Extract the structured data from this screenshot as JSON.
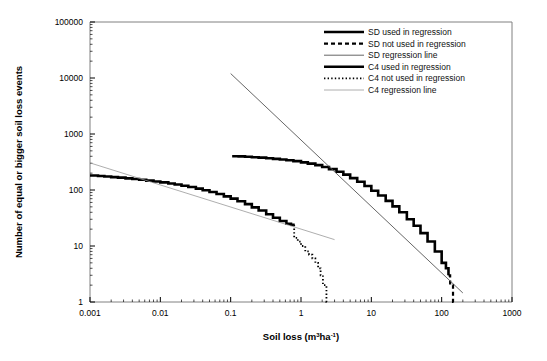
{
  "chart_data": {
    "type": "line",
    "title": "",
    "xlabel": "Soil loss (m3ha-1)",
    "xlabel_parts": {
      "base": "Soil loss (m",
      "sup1": "3",
      "mid": "ha",
      "sup2": "-1",
      "close": ")"
    },
    "ylabel": "Number of equal or bigger soil loss events",
    "xscale": "log",
    "yscale": "log",
    "xlim": [
      0.001,
      1000
    ],
    "ylim": [
      1,
      100000
    ],
    "grid": false,
    "legend_position": "top-right",
    "xticks": [
      "0.001",
      "0.01",
      "0.1",
      "1",
      "10",
      "100",
      "1000"
    ],
    "yticks": [
      "1",
      "10",
      "100",
      "1000",
      "10000",
      "100000"
    ],
    "colors": {
      "sd_used": "#000000",
      "sd_not_used": "#000000",
      "sd_regression": "#555555",
      "c4_used": "#000000",
      "c4_not_used": "#000000",
      "c4_regression": "#999999"
    },
    "series": [
      {
        "name": "SD used in regression",
        "style": "solid-thick",
        "color": "#000000",
        "points": [
          [
            0.105,
            400
          ],
          [
            0.13,
            398
          ],
          [
            0.16,
            392
          ],
          [
            0.2,
            385
          ],
          [
            0.25,
            378
          ],
          [
            0.32,
            370
          ],
          [
            0.4,
            360
          ],
          [
            0.5,
            350
          ],
          [
            0.62,
            340
          ],
          [
            0.78,
            328
          ],
          [
            1.0,
            312
          ],
          [
            1.25,
            296
          ],
          [
            1.6,
            278
          ],
          [
            2.0,
            258
          ],
          [
            2.5,
            236
          ],
          [
            3.2,
            212
          ],
          [
            4.0,
            188
          ],
          [
            5.0,
            163
          ],
          [
            6.3,
            140
          ],
          [
            8.0,
            118
          ],
          [
            10.0,
            97
          ],
          [
            12.5,
            80
          ],
          [
            16.0,
            64
          ],
          [
            20.0,
            51
          ],
          [
            25.0,
            40
          ],
          [
            32.0,
            30
          ],
          [
            40.0,
            23
          ],
          [
            50.0,
            17
          ],
          [
            63.0,
            12
          ],
          [
            80.0,
            8
          ],
          [
            100.0,
            5
          ],
          [
            115.0,
            4
          ],
          [
            125.0,
            3
          ]
        ]
      },
      {
        "name": "SD not used in regression",
        "style": "dashed",
        "color": "#000000",
        "points": [
          [
            125.0,
            3
          ],
          [
            130.0,
            3
          ],
          [
            132.0,
            2
          ],
          [
            140.0,
            2
          ],
          [
            145.0,
            1
          ],
          [
            148.0,
            1
          ]
        ]
      },
      {
        "name": "SD regression line",
        "style": "solid-thin",
        "color": "#555555",
        "points": [
          [
            0.1,
            12000
          ],
          [
            200.0,
            1.45
          ]
        ]
      },
      {
        "name": "C4 used in regression",
        "style": "solid-thick",
        "color": "#000000",
        "points": [
          [
            0.001,
            182
          ],
          [
            0.0013,
            178
          ],
          [
            0.0016,
            174
          ],
          [
            0.002,
            170
          ],
          [
            0.0025,
            166
          ],
          [
            0.0032,
            161
          ],
          [
            0.004,
            157
          ],
          [
            0.005,
            152
          ],
          [
            0.0063,
            147
          ],
          [
            0.008,
            142
          ],
          [
            0.01,
            137
          ],
          [
            0.013,
            131
          ],
          [
            0.016,
            125
          ],
          [
            0.02,
            119
          ],
          [
            0.025,
            113
          ],
          [
            0.032,
            106
          ],
          [
            0.04,
            99
          ],
          [
            0.05,
            92
          ],
          [
            0.063,
            85
          ],
          [
            0.08,
            77
          ],
          [
            0.1,
            70
          ],
          [
            0.125,
            63
          ],
          [
            0.16,
            56
          ],
          [
            0.2,
            49
          ],
          [
            0.25,
            43
          ],
          [
            0.32,
            37
          ],
          [
            0.4,
            32
          ],
          [
            0.5,
            28
          ],
          [
            0.62,
            25
          ],
          [
            0.72,
            24
          ],
          [
            0.78,
            23
          ]
        ]
      },
      {
        "name": "C4 not used in regression",
        "style": "dotted",
        "color": "#000000",
        "points": [
          [
            0.78,
            23
          ],
          [
            0.8,
            14
          ],
          [
            0.9,
            12
          ],
          [
            1.0,
            10
          ],
          [
            1.15,
            8
          ],
          [
            1.3,
            7
          ],
          [
            1.45,
            6
          ],
          [
            1.6,
            5
          ],
          [
            1.75,
            4
          ],
          [
            1.9,
            3
          ],
          [
            2.05,
            2
          ],
          [
            2.2,
            2
          ],
          [
            2.3,
            1
          ],
          [
            2.35,
            1
          ]
        ]
      },
      {
        "name": "C4 regression line",
        "style": "solid-thin-light",
        "color": "#999999",
        "points": [
          [
            0.001,
            305
          ],
          [
            3.0,
            13
          ]
        ]
      }
    ],
    "legend_entries": [
      {
        "label": "SD used in regression",
        "style": "solid-thick",
        "color": "#000000"
      },
      {
        "label": "SD not used in regression",
        "style": "dashed",
        "color": "#000000"
      },
      {
        "label": "SD regression line",
        "style": "solid-thin",
        "color": "#555555"
      },
      {
        "label": "C4 used in regression",
        "style": "solid-thick",
        "color": "#000000"
      },
      {
        "label": "C4 not used in regression",
        "style": "dotted",
        "color": "#000000"
      },
      {
        "label": "C4 regression line",
        "style": "solid-thin-light",
        "color": "#999999"
      }
    ]
  }
}
